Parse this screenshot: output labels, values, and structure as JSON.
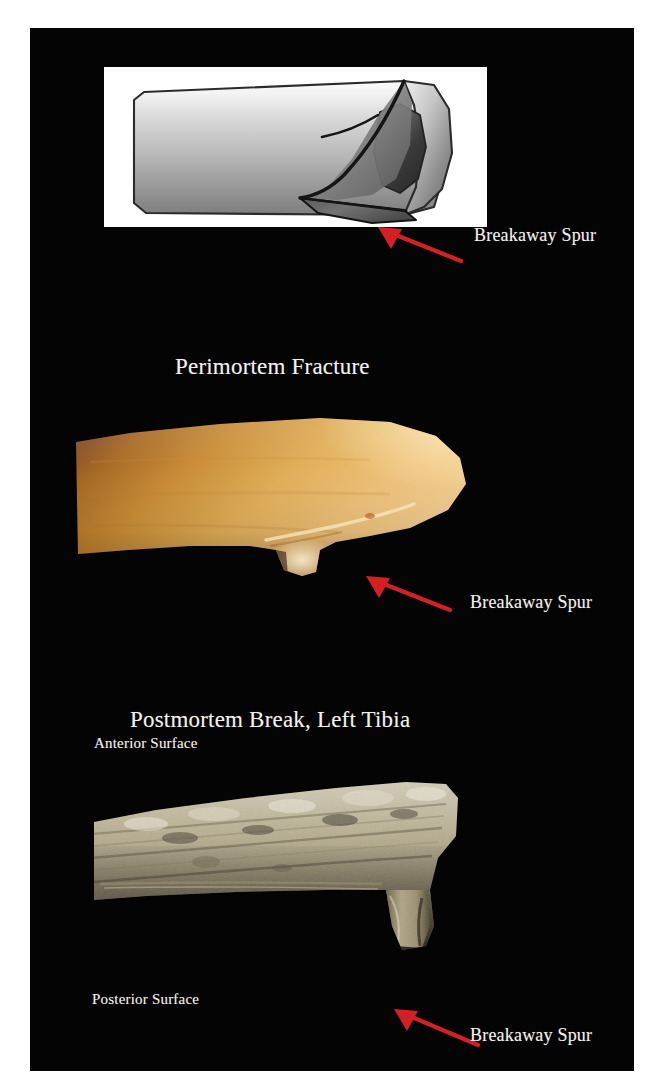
{
  "figure": {
    "background_color": "#ffffff",
    "plate_color": "#050405",
    "text_color": "#f2f0ec",
    "arrow_color": "#d41f24"
  },
  "panels": [
    {
      "id": "schematic",
      "kind": "line-drawing",
      "title": "",
      "callout": "Breakaway Spur",
      "inset_background": "#ffffff"
    },
    {
      "id": "perimortem",
      "kind": "photograph",
      "title": "Perimortem Fracture",
      "callout": "Breakaway Spur"
    },
    {
      "id": "postmortem",
      "kind": "photograph",
      "title": "Postmortem Break, Left Tibia",
      "callout": "Breakaway Spur",
      "surface_top": "Anterior Surface",
      "surface_bottom": "Posterior Surface"
    }
  ],
  "labels": {
    "schematic_callout": "Breakaway Spur",
    "perimortem_title": "Perimortem Fracture",
    "perimortem_callout": "Breakaway Spur",
    "postmortem_title": "Postmortem Break, Left Tibia",
    "postmortem_anterior": "Anterior Surface",
    "postmortem_posterior": "Posterior Surface",
    "postmortem_callout": "Breakaway Spur"
  },
  "icons": {
    "arrow": "arrow-up-left-icon"
  }
}
